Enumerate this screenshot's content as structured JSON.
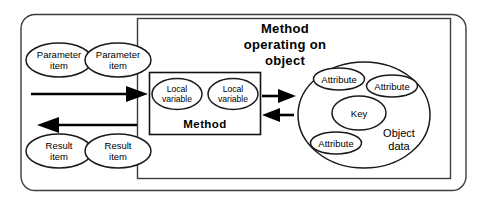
{
  "diagram": {
    "title": "Method operating on object",
    "title_lines": [
      "Method",
      "operating  on",
      "object"
    ],
    "outer_container_name": "object-boundary",
    "method_box": {
      "label": "Method",
      "local_variables": [
        {
          "line1": "Local",
          "line2": "variable"
        },
        {
          "line1": "Local",
          "line2": "variable"
        }
      ]
    },
    "parameters": [
      {
        "line1": "Parameter",
        "line2": "item"
      },
      {
        "line1": "Parameter",
        "line2": "item"
      }
    ],
    "results": [
      {
        "line1": "Result",
        "line2": "item"
      },
      {
        "line1": "Result",
        "line2": "item"
      }
    ],
    "object_data": {
      "label_line1": "Object",
      "label_line2": "data",
      "key_label": "Key",
      "attributes": [
        "Attribute",
        "Attribute",
        "Attribute"
      ]
    },
    "arrows": [
      {
        "name": "parameters-in-arrow",
        "direction": "right"
      },
      {
        "name": "results-out-arrow",
        "direction": "left"
      },
      {
        "name": "method-to-object-arrow",
        "direction": "right"
      },
      {
        "name": "object-to-method-arrow",
        "direction": "left"
      }
    ],
    "colors": {
      "stroke": "#3d3d3d",
      "stroke_dark": "#111111",
      "arrow": "#000000",
      "background": "#ffffff"
    }
  }
}
